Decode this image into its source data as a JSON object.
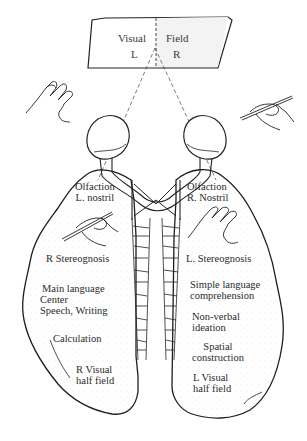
{
  "visual_field": {
    "left_word": "Visual",
    "right_word": "Field",
    "left_side": "L",
    "right_side": "R"
  },
  "left_hemisphere": {
    "labels": [
      {
        "line1": "Olfaction",
        "line2": "L. nostril"
      },
      {
        "line1": "R  Stereognosis"
      },
      {
        "line1": "Main language",
        "line2": "Center",
        "line3": "Speech, Writing"
      },
      {
        "line1": "Calculation"
      },
      {
        "line1": "R Visual",
        "line2": "half field"
      }
    ]
  },
  "right_hemisphere": {
    "labels": [
      {
        "line1": "Olfaction",
        "line2": "R. Nostril"
      },
      {
        "line1": "L.  Stereognosis"
      },
      {
        "line1": "Simple language",
        "line2": "comprehension"
      },
      {
        "line1": "Non-verbal",
        "line2": "ideation"
      },
      {
        "line1": "Spatial",
        "line2": "construction"
      },
      {
        "line1": "L Visual",
        "line2": "half field"
      }
    ]
  },
  "icons": {
    "left_top": "open-hand",
    "right_top": "hand-holding-pen",
    "left_inner": "hand-holding-pen",
    "right_inner": "open-hand"
  },
  "colors": {
    "line": "#222222",
    "stipple": "#bdbdbd",
    "background": "#ffffff"
  }
}
